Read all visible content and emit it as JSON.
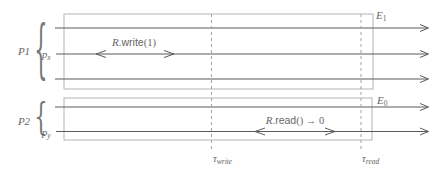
{
  "figure_kind": "register-execution-timeline-diagram",
  "colors": {
    "background": "#ffffff",
    "timeline": "#5b5b5b",
    "box_border": "#b4b4b4",
    "dashed_marker": "#a3a3a3",
    "text": "#666666"
  },
  "p1": {
    "group_label": "P1",
    "brace_glyph": "{",
    "process": {
      "base": "p",
      "sub": "x"
    },
    "box_label": {
      "base": "E",
      "sub": "1"
    },
    "operation": {
      "object": "R",
      "separator": ".",
      "method": "write",
      "arguments": "(1)"
    }
  },
  "p2": {
    "group_label": "P2",
    "brace_glyph": "{",
    "process": {
      "base": "p",
      "sub": "y"
    },
    "box_label": {
      "base": "E",
      "sub": "0"
    },
    "operation": {
      "object": "R",
      "separator": ".",
      "method": "read",
      "arguments": "() → 0"
    }
  },
  "time_markers": {
    "write": {
      "base": "τ",
      "sub": "write"
    },
    "read": {
      "base": "τ",
      "sub": "read"
    }
  }
}
